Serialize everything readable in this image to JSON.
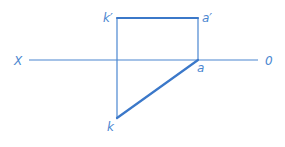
{
  "diagram": {
    "type": "orthographic-projection",
    "axis": {
      "left_label": "X",
      "right_label": "0"
    },
    "points": {
      "k_prime": {
        "label": "k′"
      },
      "a_prime": {
        "label": "a′"
      },
      "a": {
        "label": "a"
      },
      "k": {
        "label": "k"
      }
    },
    "segments": [
      {
        "from": "k_prime",
        "to": "a_prime",
        "style": "thick"
      },
      {
        "from": "a",
        "to": "k",
        "style": "thick"
      },
      {
        "from": "k_prime",
        "to": "k",
        "style": "thin"
      },
      {
        "from": "a_prime",
        "to": "a",
        "style": "thin"
      }
    ],
    "colors": {
      "line": "#3b78c9",
      "label": "#4a86d0"
    }
  }
}
